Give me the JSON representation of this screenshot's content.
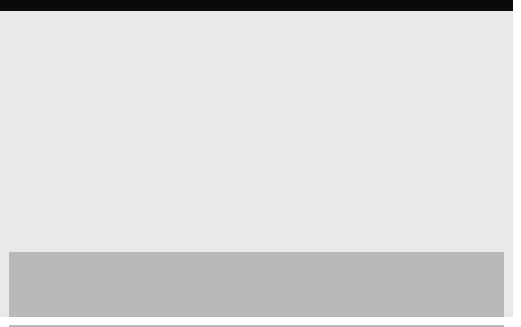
{
  "figure": {
    "background_color": "#e9e9e9",
    "legend_background_color": "#b9b9b9",
    "top_bar_color": "#0a0a0a"
  },
  "axes": {
    "y_ticks": [
      "200",
      "150",
      "100",
      "50",
      "0"
    ],
    "x_ticks": [
      "1980",
      "1983",
      "1986",
      "1989",
      "1992",
      "1995",
      "1998",
      "2001",
      "2004",
      "2007"
    ]
  },
  "legend": {
    "left_column": [
      {
        "label": "East Asia and the Pacific (8)",
        "color": "#5a5a5a"
      },
      {
        "label": "Middle East and North Africa (7)",
        "color": "#0a0a0a"
      },
      {
        "label": "Sub-Saharan Africa (10)",
        "color": "#b9b9b9"
      }
    ],
    "right_column": [
      {
        "label": "Latin America and the Caribbean (10)",
        "color": "#7d7d7d"
      },
      {
        "label": "South Asia (7)",
        "color": "#cfcfcf"
      },
      {
        "label": "Europe and Central Asia (9)",
        "color": "#ffffff"
      }
    ]
  },
  "chart_data": {
    "type": "area",
    "stacked": true,
    "xlabel": "",
    "ylabel": "Billion constant 2005 PPP dollars",
    "ylim": [
      0,
      200
    ],
    "yticks": [
      0,
      50,
      100,
      150,
      200
    ],
    "grid": true,
    "legend_position": "bottom",
    "x": [
      1980,
      1981,
      1982,
      1983,
      1984,
      1985,
      1986,
      1987,
      1988,
      1989,
      1990,
      1991,
      1992,
      1993,
      1994,
      1995,
      1996,
      1997,
      1998,
      1999,
      2000,
      2001,
      2002,
      2003,
      2004,
      2005,
      2006,
      2007
    ],
    "xticks": [
      1980,
      1983,
      1986,
      1989,
      1992,
      1995,
      1998,
      2001,
      2004,
      2007
    ],
    "series": [
      {
        "name": "East Asia and the Pacific (8)",
        "color": "#5a5a5a",
        "values": [
          22,
          24,
          25,
          26,
          26,
          27,
          27,
          28,
          29,
          30,
          31,
          32,
          34,
          36,
          38,
          41,
          44,
          47,
          44,
          48,
          52,
          55,
          58,
          62,
          68,
          76,
          86,
          92
        ]
      },
      {
        "name": "Latin America and the Caribbean (10)",
        "color": "#7d7d7d",
        "values": [
          15,
          14,
          13,
          12,
          11,
          11,
          11,
          10,
          10,
          10,
          10,
          10,
          10,
          10,
          11,
          11,
          12,
          12,
          13,
          12,
          12,
          13,
          13,
          13,
          14,
          14,
          14,
          15
        ]
      },
      {
        "name": "Middle East and North Africa (7)",
        "color": "#0a0a0a",
        "values": [
          4,
          4,
          5,
          5,
          5,
          5,
          5,
          5,
          5,
          5,
          5,
          6,
          6,
          6,
          7,
          7,
          8,
          8,
          9,
          9,
          9,
          9,
          10,
          11,
          12,
          13,
          14,
          15
        ]
      },
      {
        "name": "South Asia (7)",
        "color": "#cfcfcf",
        "values": [
          9,
          9,
          10,
          10,
          10,
          10,
          10,
          10,
          10,
          11,
          11,
          11,
          12,
          12,
          13,
          14,
          15,
          16,
          16,
          17,
          18,
          19,
          20,
          22,
          23,
          25,
          27,
          28
        ]
      },
      {
        "name": "Sub-Saharan Africa (10)",
        "color": "#b9b9b9",
        "values": [
          1,
          1,
          1,
          1,
          1,
          1,
          1,
          1,
          1,
          1,
          1,
          1,
          1,
          2,
          2,
          2,
          2,
          2,
          3,
          3,
          3,
          3,
          3,
          3,
          4,
          4,
          4,
          4
        ]
      },
      {
        "name": "Europe and Central Asia (9)",
        "color": "#ffffff",
        "values": [
          0,
          0,
          0,
          0,
          0,
          0,
          0,
          0,
          0,
          0,
          0,
          1,
          1,
          2,
          3,
          4,
          5,
          7,
          9,
          9,
          9,
          10,
          11,
          12,
          13,
          14,
          15,
          16
        ]
      }
    ]
  }
}
